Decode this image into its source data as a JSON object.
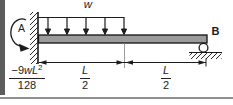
{
  "figure": {
    "type": "propped-cantilever-beam-diagram",
    "labels": {
      "distributed_load": "w",
      "left_support": "A",
      "right_support": "B"
    },
    "moment_value": {
      "prefix": "−9",
      "variables": "wL",
      "exponent": "2",
      "denominator": "128"
    },
    "spans": [
      {
        "numerator": "L",
        "denominator": "2"
      },
      {
        "numerator": "L",
        "denominator": "2"
      }
    ],
    "colors": {
      "beam_fill": "#9b9b9b",
      "ink": "#1c1c1c",
      "left_edge_bar": "#5c5c5c",
      "bottom_rule": "#8f8f8f",
      "midline_gray": "#9a9a9a"
    }
  }
}
